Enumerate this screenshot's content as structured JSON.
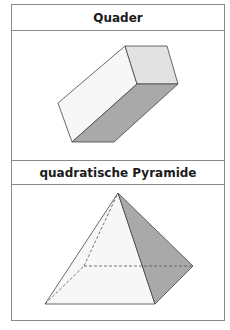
{
  "sections": [
    {
      "title": "Quader",
      "shape": "cuboid",
      "colors": {
        "side_face": "#f7f7f7",
        "end_face": "#e2e2e2",
        "bottom_face": "#a9a9a9",
        "edge": "#444444"
      }
    },
    {
      "title": "quadratische Pyramide",
      "shape": "square-pyramid",
      "colors": {
        "front_face": "#f7f7f7",
        "right_face": "#a9a9a9",
        "edge": "#444444",
        "hidden_edge": "#555555"
      }
    }
  ]
}
